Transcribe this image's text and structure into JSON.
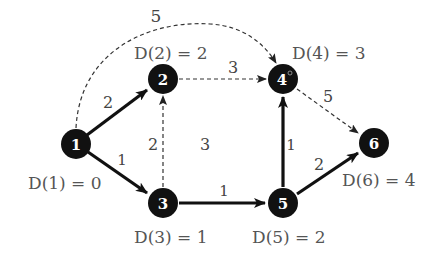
{
  "graph": {
    "nodes": [
      {
        "id": "1",
        "label": "1",
        "distance_label": "D(1) = 0",
        "x": 76,
        "y": 144
      },
      {
        "id": "2",
        "label": "2",
        "distance_label": "D(2) = 2",
        "x": 163,
        "y": 79
      },
      {
        "id": "3",
        "label": "3",
        "distance_label": "D(3) = 1",
        "x": 163,
        "y": 203
      },
      {
        "id": "4",
        "label": "4",
        "distance_label": "D(4) = 3",
        "x": 283,
        "y": 79
      },
      {
        "id": "5",
        "label": "5",
        "distance_label": "D(5) = 2",
        "x": 283,
        "y": 203
      },
      {
        "id": "6",
        "label": "6",
        "distance_label": "D(6) = 4",
        "x": 374,
        "y": 143
      }
    ],
    "edges": [
      {
        "from": "1",
        "to": "2",
        "weight": "2",
        "style": "solid"
      },
      {
        "from": "1",
        "to": "3",
        "weight": "1",
        "style": "solid"
      },
      {
        "from": "1",
        "to": "4",
        "weight": "5",
        "style": "dashed-curve"
      },
      {
        "from": "2",
        "to": "4",
        "weight": "3",
        "style": "dashed"
      },
      {
        "from": "3",
        "to": "2",
        "weight": "2",
        "style": "dashed"
      },
      {
        "from": "3",
        "to": "5",
        "weight": "1",
        "style": "solid"
      },
      {
        "from": "5",
        "to": "4",
        "weight": "1",
        "style": "solid"
      },
      {
        "from": "4",
        "to": "6",
        "weight": "5",
        "style": "dashed"
      },
      {
        "from": "5",
        "to": "6",
        "weight": "2",
        "style": "solid"
      }
    ],
    "face_label": "3"
  },
  "colors": {
    "node_fill": "#111111",
    "edge": "#222222",
    "text": "#555555"
  }
}
